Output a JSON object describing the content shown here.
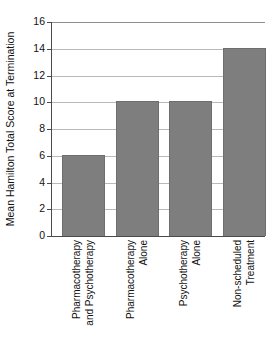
{
  "figure": {
    "title_remnant": "",
    "background": "#ffffff",
    "bar_color": "#7e7e7e",
    "grid_color": "#b9b9b9",
    "axis_color": "#4a4a4a"
  },
  "chart_data": {
    "type": "bar",
    "title": "",
    "xlabel": "",
    "ylabel": "Mean Hamilton Total Score at Termination",
    "ylim": [
      0,
      16
    ],
    "ytick_step": 2,
    "yticks": [
      0,
      2,
      4,
      6,
      8,
      10,
      12,
      14,
      16
    ],
    "ytick_labels": [
      "0",
      "2",
      "4",
      "6",
      "8",
      "10",
      "12",
      "14",
      "16"
    ],
    "grid": "horizontal",
    "legend": "none",
    "categories": [
      "Pharmacotherapy and Psychotherapy",
      "Pharmacotherapy Alone",
      "Psychotherapy Alone",
      "Non-scheduled Treatment"
    ],
    "category_lines": [
      [
        "Pharmacotherapy",
        "and Psychotherapy"
      ],
      [
        "Pharmacotherapy",
        "Alone"
      ],
      [
        "Psychotherapy",
        "Alone"
      ],
      [
        "Non-scheduled",
        "Treatment"
      ]
    ],
    "values": [
      6,
      10,
      10,
      14
    ],
    "series": [
      {
        "name": "Mean Hamilton Total Score at Termination",
        "values": [
          6,
          10,
          10,
          14
        ]
      }
    ]
  }
}
